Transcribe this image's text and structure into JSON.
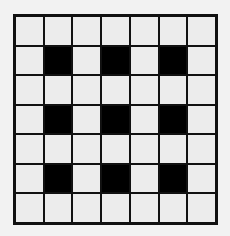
{
  "grid": {
    "rows": 7,
    "cols": 7,
    "colors": {
      "filled": "#000000",
      "empty": "#ececec",
      "line": "#111111"
    },
    "cells": [
      [
        0,
        0,
        0,
        0,
        0,
        0,
        0
      ],
      [
        0,
        1,
        0,
        1,
        0,
        1,
        0
      ],
      [
        0,
        0,
        0,
        0,
        0,
        0,
        0
      ],
      [
        0,
        1,
        0,
        1,
        0,
        1,
        0
      ],
      [
        0,
        0,
        0,
        0,
        0,
        0,
        0
      ],
      [
        0,
        1,
        0,
        1,
        0,
        1,
        0
      ],
      [
        0,
        0,
        0,
        0,
        0,
        0,
        0
      ]
    ]
  }
}
